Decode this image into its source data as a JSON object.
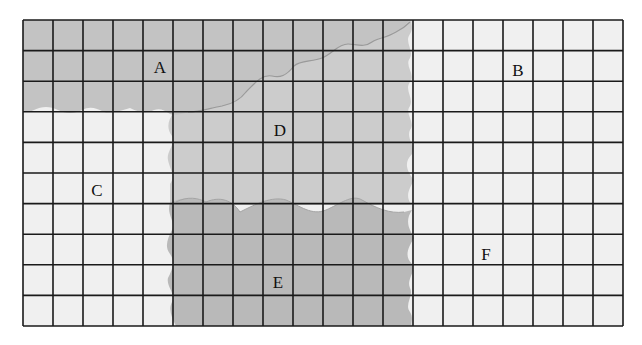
{
  "diagram": {
    "grid": {
      "columns": 20,
      "rows": 10,
      "x": 23,
      "y": 20,
      "width": 600,
      "height": 306,
      "line_color": "#1a1a1a"
    },
    "colors": {
      "background": "#ffffff",
      "light_region": "#f0f0f0",
      "region_a": "#c3c3c3",
      "region_d": "#cccccc",
      "region_e": "#b9b9b9",
      "boundary_line": "#9a9a9a"
    },
    "regions": [
      {
        "id": "A",
        "label": "A",
        "shade": "medium-gray",
        "label_x": 160,
        "label_y": 73
      },
      {
        "id": "B",
        "label": "B",
        "shade": "light",
        "label_x": 518,
        "label_y": 76
      },
      {
        "id": "C",
        "label": "C",
        "shade": "light",
        "label_x": 97,
        "label_y": 196
      },
      {
        "id": "D",
        "label": "D",
        "shade": "light-gray",
        "label_x": 280,
        "label_y": 136
      },
      {
        "id": "E",
        "label": "E",
        "shade": "dark-gray",
        "label_x": 278,
        "label_y": 288
      },
      {
        "id": "F",
        "label": "F",
        "shade": "light",
        "label_x": 486,
        "label_y": 260
      }
    ]
  }
}
